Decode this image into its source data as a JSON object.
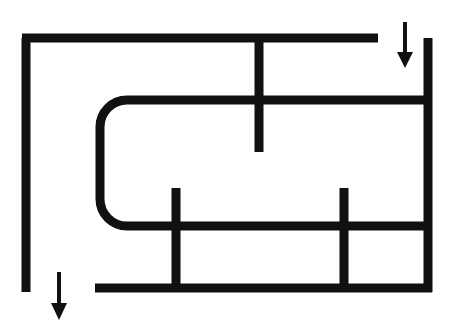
{
  "figure": {
    "canvas": {
      "width": 461,
      "height": 335
    },
    "background_color": "#ffffff",
    "ink_color": "#111111",
    "stroke_width": 9,
    "segments": [
      {
        "name": "outer-top-horizontal",
        "kind": "line",
        "x1": 22,
        "y1": 38,
        "x2": 378,
        "y2": 38
      },
      {
        "name": "outer-left-vertical",
        "kind": "line",
        "x1": 26,
        "y1": 38,
        "x2": 26,
        "y2": 292
      },
      {
        "name": "right-outer-vertical",
        "kind": "line",
        "x1": 428,
        "y1": 38,
        "x2": 428,
        "y2": 292
      },
      {
        "name": "upper-center-vertical-stub",
        "kind": "line",
        "x1": 259,
        "y1": 38,
        "x2": 259,
        "y2": 152
      },
      {
        "name": "rounded-hook",
        "kind": "path",
        "d": "M 432 100 L 127 100 A 27 27 0 0 0 100 127 L 100 199 A 27 27 0 0 0 127 226 L 432 226"
      },
      {
        "name": "bottom-horizontal",
        "kind": "line",
        "x1": 95,
        "y1": 288,
        "x2": 432,
        "y2": 288
      },
      {
        "name": "lower-left-vertical",
        "kind": "line",
        "x1": 176,
        "y1": 188,
        "x2": 176,
        "y2": 292
      },
      {
        "name": "lower-right-vertical",
        "kind": "line",
        "x1": 344,
        "y1": 188,
        "x2": 344,
        "y2": 292
      }
    ],
    "arrows": [
      {
        "name": "arrow-top-right",
        "direction": "down",
        "shaft_x": 405,
        "shaft_y1": 22,
        "shaft_y2": 52,
        "tip_y": 68,
        "head_half_width": 8,
        "shaft_width": 4
      },
      {
        "name": "arrow-bottom-left",
        "direction": "down",
        "shaft_x": 59,
        "shaft_y1": 272,
        "shaft_y2": 303,
        "tip_y": 320,
        "head_half_width": 8,
        "shaft_width": 4
      }
    ]
  }
}
